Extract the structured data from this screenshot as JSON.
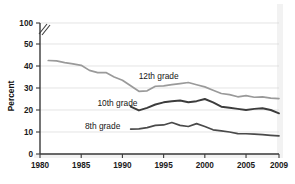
{
  "chart_data": {
    "type": "line",
    "title": "",
    "subtitle": "",
    "xlabel": "",
    "ylabel": "Percent",
    "xlim": [
      1980,
      2009
    ],
    "ylim": [
      0,
      50
    ],
    "grid": true,
    "grid_axis": "y",
    "legend_position": "inline-labels",
    "y_axis_break": {
      "present": true,
      "between": [
        50,
        100
      ],
      "symbol": "double-slash"
    },
    "xticks": [
      1980,
      1985,
      1990,
      1995,
      2000,
      2005,
      2009
    ],
    "xtick_labels": [
      "1980",
      "1985",
      "1990",
      "1995",
      "2000",
      "2005",
      "2009"
    ],
    "yticks": [
      0,
      10,
      20,
      30,
      40,
      50,
      100
    ],
    "ytick_labels": [
      "0",
      "10",
      "20",
      "30",
      "40",
      "50",
      "100"
    ],
    "series": [
      {
        "name": "12th grade",
        "label": "12th grade",
        "color": "#9a9a9a",
        "stroke_width": 1.7,
        "label_x": 1994.4,
        "label_y": 35.6,
        "x": [
          1981,
          1982,
          1983,
          1984,
          1985,
          1986,
          1987,
          1988,
          1989,
          1990,
          1991,
          1992,
          1993,
          1994,
          1995,
          1996,
          1997,
          1998,
          1999,
          2000,
          2001,
          2002,
          2003,
          2004,
          2005,
          2006,
          2007,
          2008,
          2009
        ],
        "values": [
          42.5,
          42.3,
          41.5,
          41.0,
          40.3,
          38.0,
          37.0,
          37.0,
          35.0,
          33.5,
          31.0,
          28.5,
          28.7,
          30.8,
          31.0,
          31.5,
          32.0,
          32.5,
          31.5,
          30.5,
          29.0,
          27.5,
          27.0,
          26.0,
          26.5,
          25.8,
          26.0,
          25.4,
          25.2
        ]
      },
      {
        "name": "10th grade",
        "label": "10th grade",
        "color": "#3c3c3c",
        "stroke_width": 1.9,
        "label_x": 1989.4,
        "label_y": 23.3,
        "x": [
          1991,
          1992,
          1993,
          1994,
          1995,
          1996,
          1997,
          1998,
          1999,
          2000,
          2001,
          2002,
          2003,
          2004,
          2005,
          2006,
          2007,
          2008,
          2009
        ],
        "values": [
          21.5,
          19.8,
          21.0,
          22.5,
          23.5,
          24.0,
          24.3,
          23.5,
          24.0,
          25.0,
          23.5,
          21.5,
          21.0,
          20.5,
          20.0,
          20.5,
          20.8,
          20.0,
          18.5
        ]
      },
      {
        "name": "8th grade",
        "label": "8th grade",
        "color": "#4a4a4a",
        "stroke_width": 1.7,
        "label_x": 1987.6,
        "label_y": 12.6,
        "x": [
          1991,
          1992,
          1993,
          1994,
          1995,
          1996,
          1997,
          1998,
          1999,
          2000,
          2001,
          2002,
          2003,
          2004,
          2005,
          2006,
          2007,
          2008,
          2009
        ],
        "values": [
          11.3,
          11.4,
          12.0,
          13.0,
          13.2,
          14.3,
          13.0,
          12.5,
          13.8,
          12.5,
          11.0,
          10.5,
          10.0,
          9.3,
          9.2,
          9.0,
          8.8,
          8.5,
          8.2
        ]
      }
    ]
  },
  "axis": {
    "y_title": "Percent"
  }
}
